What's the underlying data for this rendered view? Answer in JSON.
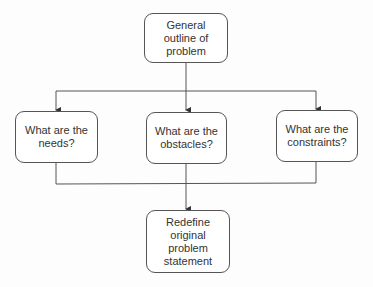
{
  "diagram": {
    "type": "flowchart",
    "colors": {
      "line": "#555555",
      "text": "#333333",
      "background": "#fdfdfd"
    },
    "nodes": {
      "top": {
        "label": "General outline of problem"
      },
      "needs": {
        "label": "What are the needs?"
      },
      "obstacles": {
        "label": "What are the obstacles?"
      },
      "constraints": {
        "label": "What are the constraints?"
      },
      "bottom": {
        "label": "Redefine original problem statement"
      }
    },
    "edges": [
      {
        "from": "General outline of problem",
        "to": "What are the needs?"
      },
      {
        "from": "General outline of problem",
        "to": "What are the obstacles?"
      },
      {
        "from": "General outline of problem",
        "to": "What are the constraints?"
      },
      {
        "from": "What are the needs?",
        "to": "Redefine original problem statement"
      },
      {
        "from": "What are the obstacles?",
        "to": "Redefine original problem statement"
      },
      {
        "from": "What are the constraints?",
        "to": "Redefine original problem statement"
      }
    ]
  }
}
